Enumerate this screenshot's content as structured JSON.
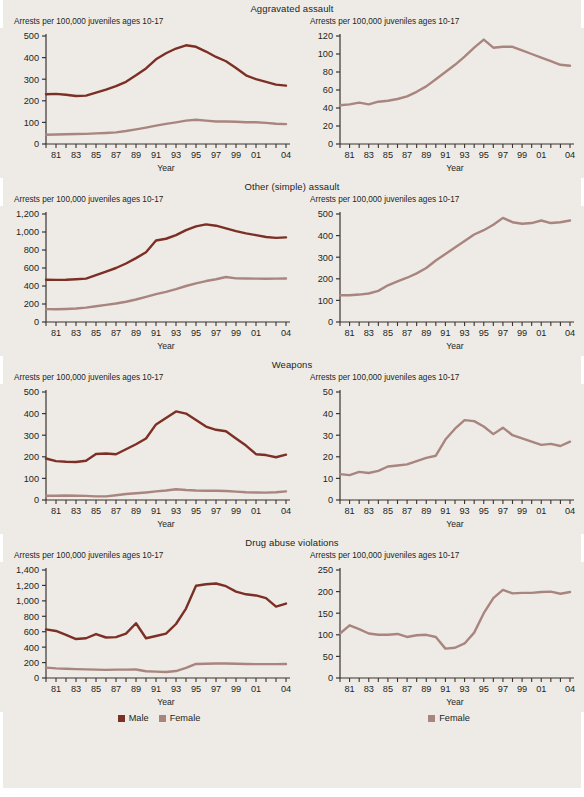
{
  "colors": {
    "male": "#7c2f24",
    "female": "#a8857f",
    "axis": "#3a3330",
    "background": "#eeebe6",
    "text": "#231f1c"
  },
  "legend": {
    "left": [
      {
        "label": "Male",
        "color": "#7c2f24"
      },
      {
        "label": "Female",
        "color": "#a8857f"
      }
    ],
    "right": [
      {
        "label": "Female",
        "color": "#a8857f"
      }
    ]
  },
  "common": {
    "y_caption": "Arrests per 100,000 juveniles ages 10-17",
    "x_title": "Year",
    "x_tick_labels": [
      "81",
      "83",
      "85",
      "87",
      "89",
      "91",
      "93",
      "95",
      "97",
      "99",
      "01",
      "04"
    ],
    "x_years": [
      1980,
      1981,
      1982,
      1983,
      1984,
      1985,
      1986,
      1987,
      1988,
      1989,
      1990,
      1991,
      1992,
      1993,
      1994,
      1995,
      1996,
      1997,
      1998,
      1999,
      2000,
      2001,
      2002,
      2003,
      2004
    ]
  },
  "panels": [
    {
      "title": "Aggravated assault",
      "left": {
        "y_ticks": [
          "0",
          "100",
          "200",
          "300",
          "400",
          "500"
        ],
        "ylim": [
          0,
          500
        ]
      },
      "right": {
        "y_ticks": [
          "0",
          "20",
          "40",
          "60",
          "80",
          "100",
          "120"
        ],
        "ylim": [
          0,
          120
        ]
      }
    },
    {
      "title": "Other (simple) assault",
      "left": {
        "y_ticks": [
          "0",
          "200",
          "400",
          "600",
          "800",
          "1,000",
          "1,200"
        ],
        "ylim": [
          0,
          1200
        ]
      },
      "right": {
        "y_ticks": [
          "0",
          "100",
          "200",
          "300",
          "400",
          "500"
        ],
        "ylim": [
          0,
          500
        ]
      }
    },
    {
      "title": "Weapons",
      "left": {
        "y_ticks": [
          "0",
          "100",
          "200",
          "300",
          "400",
          "500"
        ],
        "ylim": [
          0,
          500
        ]
      },
      "right": {
        "y_ticks": [
          "0",
          "10",
          "20",
          "30",
          "40",
          "50"
        ],
        "ylim": [
          0,
          50
        ]
      }
    },
    {
      "title": "Drug abuse violations",
      "left": {
        "y_ticks": [
          "0",
          "200",
          "400",
          "600",
          "800",
          "1,000",
          "1,200",
          "1,400"
        ],
        "ylim": [
          0,
          1400
        ]
      },
      "right": {
        "y_ticks": [
          "0",
          "50",
          "100",
          "150",
          "200",
          "250"
        ],
        "ylim": [
          0,
          250
        ]
      }
    }
  ],
  "chart_data": [
    {
      "type": "line",
      "title": "Aggravated assault — Male and Female",
      "xlabel": "Year",
      "ylabel": "Arrests per 100,000 juveniles ages 10-17",
      "x": [
        1980,
        1981,
        1982,
        1983,
        1984,
        1985,
        1986,
        1987,
        1988,
        1989,
        1990,
        1991,
        1992,
        1993,
        1994,
        1995,
        1996,
        1997,
        1998,
        1999,
        2000,
        2001,
        2002,
        2003,
        2004
      ],
      "ylim": [
        0,
        500
      ],
      "grid": false,
      "legend_position": "bottom",
      "series": [
        {
          "name": "Male",
          "color": "#7c2f24",
          "values": [
            230,
            232,
            228,
            222,
            224,
            238,
            252,
            268,
            288,
            318,
            350,
            392,
            420,
            442,
            457,
            450,
            428,
            403,
            383,
            352,
            318,
            300,
            288,
            275,
            270
          ]
        },
        {
          "name": "Female",
          "color": "#a8857f",
          "values": [
            43,
            44,
            45,
            46,
            47,
            49,
            51,
            54,
            60,
            68,
            76,
            85,
            93,
            100,
            108,
            112,
            108,
            104,
            104,
            103,
            101,
            101,
            98,
            94,
            92
          ]
        }
      ]
    },
    {
      "type": "line",
      "title": "Aggravated assault — Female",
      "xlabel": "Year",
      "ylabel": "Arrests per 100,000 juveniles ages 10-17",
      "x": [
        1980,
        1981,
        1982,
        1983,
        1984,
        1985,
        1986,
        1987,
        1988,
        1989,
        1990,
        1991,
        1992,
        1993,
        1994,
        1995,
        1996,
        1997,
        1998,
        1999,
        2000,
        2001,
        2002,
        2003,
        2004
      ],
      "ylim": [
        0,
        120
      ],
      "grid": false,
      "legend_position": "bottom",
      "series": [
        {
          "name": "Female",
          "color": "#a8857f",
          "values": [
            43,
            44,
            46,
            44,
            47,
            48,
            50,
            53,
            58,
            64,
            72,
            80,
            88,
            97,
            107,
            116,
            107,
            108,
            108,
            104,
            100,
            96,
            92,
            88,
            87
          ]
        }
      ]
    },
    {
      "type": "line",
      "title": "Other (simple) assault — Male and Female",
      "xlabel": "Year",
      "ylabel": "Arrests per 100,000 juveniles ages 10-17",
      "x": [
        1980,
        1981,
        1982,
        1983,
        1984,
        1985,
        1986,
        1987,
        1988,
        1989,
        1990,
        1991,
        1992,
        1993,
        1994,
        1995,
        1996,
        1997,
        1998,
        1999,
        2000,
        2001,
        2002,
        2003,
        2004
      ],
      "ylim": [
        0,
        1200
      ],
      "grid": false,
      "legend_position": "bottom",
      "series": [
        {
          "name": "Male",
          "color": "#7c2f24",
          "values": [
            470,
            468,
            470,
            475,
            482,
            520,
            560,
            600,
            650,
            710,
            775,
            905,
            925,
            965,
            1020,
            1062,
            1085,
            1070,
            1040,
            1010,
            985,
            965,
            945,
            935,
            940
          ]
        },
        {
          "name": "Female",
          "color": "#a8857f",
          "values": [
            143,
            142,
            145,
            150,
            160,
            175,
            190,
            205,
            225,
            250,
            280,
            310,
            335,
            365,
            400,
            430,
            455,
            475,
            500,
            485,
            483,
            482,
            480,
            482,
            483
          ]
        }
      ]
    },
    {
      "type": "line",
      "title": "Other (simple) assault — Female",
      "xlabel": "Year",
      "ylabel": "Arrests per 100,000 juveniles ages 10-17",
      "x": [
        1980,
        1981,
        1982,
        1983,
        1984,
        1985,
        1986,
        1987,
        1988,
        1989,
        1990,
        1991,
        1992,
        1993,
        1994,
        1995,
        1996,
        1997,
        1998,
        1999,
        2000,
        2001,
        2002,
        2003,
        2004
      ],
      "ylim": [
        0,
        500
      ],
      "grid": false,
      "legend_position": "bottom",
      "series": [
        {
          "name": "Female",
          "color": "#a8857f",
          "values": [
            124,
            124,
            127,
            132,
            144,
            170,
            188,
            205,
            225,
            250,
            285,
            315,
            345,
            375,
            405,
            425,
            450,
            482,
            462,
            455,
            458,
            470,
            458,
            462,
            470
          ]
        }
      ]
    },
    {
      "type": "line",
      "title": "Weapons — Male and Female",
      "xlabel": "Year",
      "ylabel": "Arrests per 100,000 juveniles ages 10-17",
      "x": [
        1980,
        1981,
        1982,
        1983,
        1984,
        1985,
        1986,
        1987,
        1988,
        1989,
        1990,
        1991,
        1992,
        1993,
        1994,
        1995,
        1996,
        1997,
        1998,
        1999,
        2000,
        2001,
        2002,
        2003,
        2004
      ],
      "ylim": [
        0,
        500
      ],
      "grid": false,
      "legend_position": "bottom",
      "series": [
        {
          "name": "Male",
          "color": "#7c2f24",
          "values": [
            192,
            180,
            177,
            176,
            182,
            213,
            215,
            212,
            235,
            258,
            285,
            350,
            380,
            410,
            400,
            370,
            340,
            325,
            318,
            285,
            252,
            212,
            208,
            198,
            210
          ]
        },
        {
          "name": "Female",
          "color": "#a8857f",
          "values": [
            20,
            20,
            21,
            20,
            19,
            17,
            17,
            22,
            28,
            31,
            35,
            40,
            44,
            50,
            46,
            44,
            43,
            43,
            42,
            39,
            36,
            35,
            34,
            36,
            40
          ]
        }
      ]
    },
    {
      "type": "line",
      "title": "Weapons — Female",
      "xlabel": "Year",
      "ylabel": "Arrests per 100,000 juveniles ages 10-17",
      "x": [
        1980,
        1981,
        1982,
        1983,
        1984,
        1985,
        1986,
        1987,
        1988,
        1989,
        1990,
        1991,
        1992,
        1993,
        1994,
        1995,
        1996,
        1997,
        1998,
        1999,
        2000,
        2001,
        2002,
        2003,
        2004
      ],
      "ylim": [
        0,
        50
      ],
      "grid": false,
      "legend_position": "bottom",
      "series": [
        {
          "name": "Female",
          "color": "#a8857f",
          "values": [
            12,
            11.5,
            13,
            12.5,
            13.5,
            15.5,
            16,
            16.5,
            18,
            19.5,
            20.5,
            28,
            33,
            37,
            36.5,
            34,
            30.5,
            33.5,
            30,
            28.5,
            27,
            25.5,
            26,
            25,
            27
          ]
        }
      ]
    },
    {
      "type": "line",
      "title": "Drug abuse violations — Male and Female",
      "xlabel": "Year",
      "ylabel": "Arrests per 100,000 juveniles ages 10-17",
      "x": [
        1980,
        1981,
        1982,
        1983,
        1984,
        1985,
        1986,
        1987,
        1988,
        1989,
        1990,
        1991,
        1992,
        1993,
        1994,
        1995,
        1996,
        1997,
        1998,
        1999,
        2000,
        2001,
        2002,
        2003,
        2004
      ],
      "ylim": [
        0,
        1400
      ],
      "grid": false,
      "legend_position": "bottom",
      "series": [
        {
          "name": "Male",
          "color": "#7c2f24",
          "values": [
            630,
            610,
            560,
            505,
            515,
            570,
            525,
            530,
            575,
            710,
            515,
            545,
            575,
            700,
            900,
            1195,
            1215,
            1225,
            1190,
            1120,
            1085,
            1070,
            1035,
            925,
            965
          ]
        },
        {
          "name": "Female",
          "color": "#a8857f",
          "values": [
            135,
            125,
            120,
            115,
            112,
            108,
            105,
            108,
            108,
            110,
            88,
            82,
            78,
            90,
            130,
            182,
            185,
            188,
            188,
            185,
            182,
            180,
            180,
            180,
            182
          ]
        }
      ]
    },
    {
      "type": "line",
      "title": "Drug abuse violations — Female",
      "xlabel": "Year",
      "ylabel": "Arrests per 100,000 juveniles ages 10-17",
      "x": [
        1980,
        1981,
        1982,
        1983,
        1984,
        1985,
        1986,
        1987,
        1988,
        1989,
        1990,
        1991,
        1992,
        1993,
        1994,
        1995,
        1996,
        1997,
        1998,
        1999,
        2000,
        2001,
        2002,
        2003,
        2004
      ],
      "ylim": [
        0,
        250
      ],
      "grid": false,
      "legend_position": "bottom",
      "series": [
        {
          "name": "Female",
          "color": "#a8857f",
          "values": [
            103,
            122,
            113,
            103,
            100,
            100,
            102,
            95,
            99,
            100,
            95,
            68,
            70,
            80,
            105,
            150,
            185,
            204,
            196,
            197,
            197,
            199,
            200,
            195,
            199
          ]
        }
      ]
    }
  ]
}
